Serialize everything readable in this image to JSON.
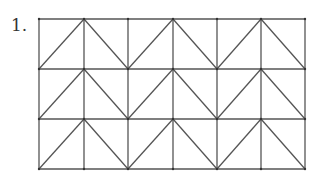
{
  "problem": {
    "number_label": "1."
  },
  "figure": {
    "type": "grid-with-zigzag-diagonals",
    "columns": 6,
    "rows": 3,
    "x_lines": [
      39,
      84,
      128,
      173,
      217,
      261,
      305
    ],
    "y_lines": [
      19,
      69,
      119,
      169
    ],
    "zigzag_pattern": "each row: diagonals from bottom corners up to peaks at columns 1, 3, 5 (x=84, 173, 261), forming Λ shapes spanning two cells",
    "stroke_color": "#555555"
  }
}
